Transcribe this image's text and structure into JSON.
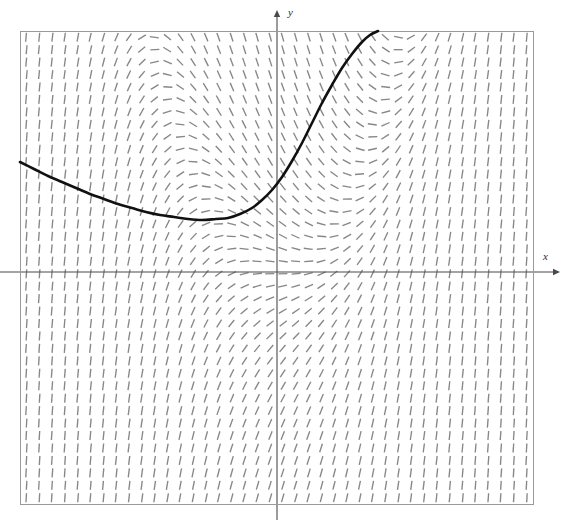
{
  "figure": {
    "kind": "slope-field",
    "background_color": "#ffffff",
    "frame": {
      "left": 20,
      "top": 31,
      "right": 533,
      "bottom": 504,
      "stroke_color": "#9a9a9a",
      "stroke_width": 1
    },
    "axes": {
      "origin_px": {
        "x": 277,
        "y": 272
      },
      "x_axis": {
        "label": "x",
        "label_px": {
          "x": 543,
          "y": 260
        },
        "from_px": {
          "x": 0,
          "y": 272
        },
        "to_px": {
          "x": 560,
          "y": 272
        },
        "arrow": "right",
        "color": "#4a4a4a"
      },
      "y_axis": {
        "label": "y",
        "label_px": {
          "x": 288,
          "y": 16
        },
        "from_px": {
          "x": 277,
          "y": 520
        },
        "to_px": {
          "x": 277,
          "y": 10
        },
        "arrow": "up",
        "color": "#4a4a4a"
      }
    },
    "field": {
      "description": "slope field of dashes",
      "cols": 40,
      "rows": 38,
      "dash_length": 9,
      "dash_color": "#6d6d6d",
      "dash_width": 1.35,
      "x_range": [
        -4.05,
        3.7
      ],
      "y_range": [
        -3.5,
        3.65
      ],
      "slope_formula": "x*x - y"
    },
    "solution_curve": {
      "color": "#111111",
      "width": 2.6,
      "points_px": [
        [
          20,
          162
        ],
        [
          34,
          169
        ],
        [
          48,
          176
        ],
        [
          62,
          182
        ],
        [
          76,
          188
        ],
        [
          90,
          194
        ],
        [
          104,
          199
        ],
        [
          118,
          204
        ],
        [
          132,
          208
        ],
        [
          146,
          212
        ],
        [
          160,
          215
        ],
        [
          174,
          217
        ],
        [
          188,
          219
        ],
        [
          202,
          220
        ],
        [
          216,
          219
        ],
        [
          228,
          218
        ],
        [
          240,
          214
        ],
        [
          252,
          208
        ],
        [
          262,
          200
        ],
        [
          272,
          190
        ],
        [
          282,
          177
        ],
        [
          292,
          161
        ],
        [
          302,
          143
        ],
        [
          312,
          123
        ],
        [
          322,
          103
        ],
        [
          332,
          85
        ],
        [
          342,
          68
        ],
        [
          352,
          54
        ],
        [
          362,
          42
        ],
        [
          370,
          35
        ],
        [
          378,
          31
        ]
      ]
    }
  }
}
